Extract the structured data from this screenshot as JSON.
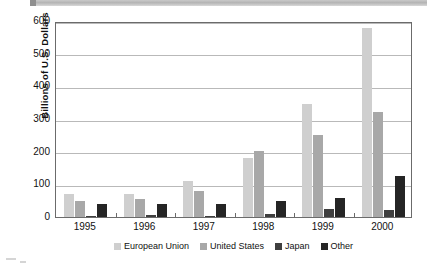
{
  "chart_data": {
    "type": "bar",
    "title": "",
    "subtitle": "",
    "xlabel": "",
    "ylabel": "Billions of U.S. Dollars",
    "categories": [
      "1995",
      "1996",
      "1997",
      "1998",
      "1999",
      "2000"
    ],
    "series": [
      {
        "name": "European Union",
        "color": "#cfcfcf",
        "values": [
          70,
          71,
          111,
          182,
          347,
          578
        ]
      },
      {
        "name": "United States",
        "color": "#a8a8a8",
        "values": [
          50,
          55,
          79,
          202,
          251,
          322
        ]
      },
      {
        "name": "Japan",
        "color": "#3f3f3f",
        "values": [
          1,
          5,
          4,
          8,
          25,
          22
        ]
      },
      {
        "name": "Other",
        "color": "#252525",
        "values": [
          39,
          40,
          41,
          48,
          58,
          127
        ]
      }
    ],
    "ylim": [
      0,
      600
    ],
    "yticks": [
      0,
      100,
      200,
      300,
      400,
      500,
      600
    ],
    "ytick_labels": [
      "0",
      "100",
      "200",
      "300",
      "400",
      "500",
      "600"
    ],
    "grid": true,
    "legend_position": "bottom"
  },
  "legend": {
    "items": [
      {
        "label": "European Union",
        "color": "#cfcfcf"
      },
      {
        "label": "United States",
        "color": "#a8a8a8"
      },
      {
        "label": "Japan",
        "color": "#3f3f3f"
      },
      {
        "label": "Other",
        "color": "#252525"
      }
    ]
  },
  "axes": {
    "y_title": "Billions of U.S. Dollars",
    "y_tick_labels": [
      "600",
      "500",
      "400",
      "300",
      "200",
      "100",
      "0"
    ],
    "x_tick_labels": [
      "1995",
      "1996",
      "1997",
      "1998",
      "1999",
      "2000"
    ]
  }
}
